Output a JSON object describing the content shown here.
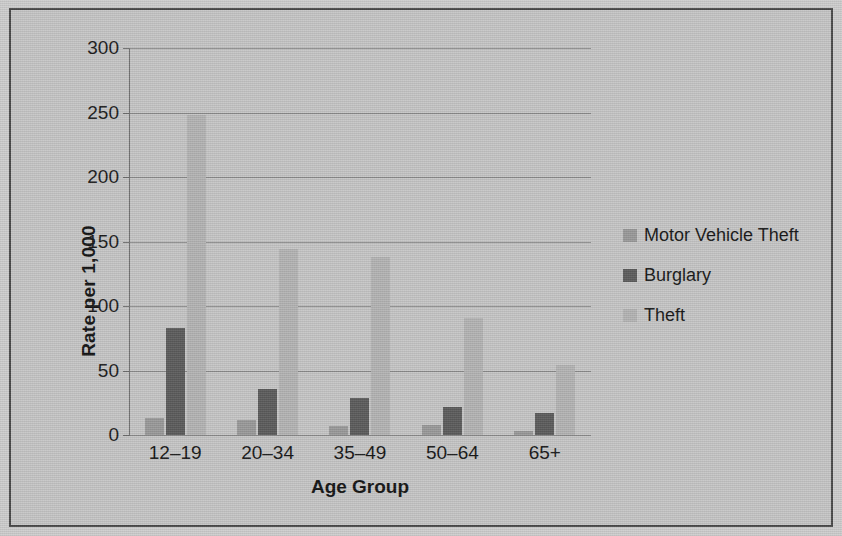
{
  "chart_data": {
    "type": "bar",
    "title": "",
    "xlabel": "Age Group",
    "ylabel": "Rate per 1,000",
    "categories": [
      "12–19",
      "20–34",
      "35–49",
      "50–64",
      "65+"
    ],
    "series": [
      {
        "name": "Motor Vehicle Theft",
        "values": [
          13,
          12,
          7,
          8,
          3
        ],
        "color": "#9a9a9a"
      },
      {
        "name": "Burglary",
        "values": [
          83,
          36,
          29,
          22,
          17
        ],
        "color": "#5c5c5c"
      },
      {
        "name": "Theft",
        "values": [
          248,
          144,
          138,
          91,
          54
        ],
        "color": "#b4b4b4"
      }
    ],
    "ylim": [
      0,
      300
    ],
    "ytick_values": [
      0,
      50,
      100,
      150,
      200,
      250,
      300
    ],
    "ytick_labels": [
      "0",
      "50",
      "100",
      "150",
      "200",
      "250",
      "300"
    ],
    "grid": true,
    "legend_position": "right"
  },
  "axes": {
    "y_title": "Rate per 1,000",
    "x_title": "Age Group",
    "ticks": [
      "300",
      "250",
      "200",
      "150",
      "100",
      "50",
      "0"
    ]
  },
  "legend": {
    "items": [
      {
        "label": "Motor Vehicle Theft",
        "color": "#9a9a9a"
      },
      {
        "label": "Burglary",
        "color": "#5c5c5c"
      },
      {
        "label": "Theft",
        "color": "#b4b4b4"
      }
    ]
  },
  "x_categories": [
    "12–19",
    "20–34",
    "35–49",
    "50–64",
    "65+"
  ],
  "colors": {
    "background": "#c6c6c6",
    "frame": "#4a4a4a",
    "gridline": "#8c8c8c",
    "text": "#141414"
  }
}
